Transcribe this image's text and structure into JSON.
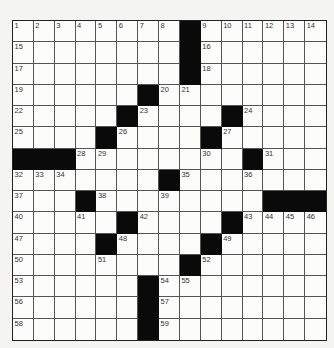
{
  "puzzle": {
    "rows": 15,
    "cols": 15,
    "black_cells": [
      [
        0,
        8
      ],
      [
        1,
        8
      ],
      [
        2,
        8
      ],
      [
        3,
        6
      ],
      [
        4,
        5
      ],
      [
        4,
        10
      ],
      [
        5,
        4
      ],
      [
        5,
        9
      ],
      [
        6,
        0
      ],
      [
        6,
        1
      ],
      [
        6,
        2
      ],
      [
        6,
        11
      ],
      [
        7,
        7
      ],
      [
        8,
        3
      ],
      [
        8,
        12
      ],
      [
        8,
        13
      ],
      [
        8,
        14
      ],
      [
        9,
        5
      ],
      [
        9,
        10
      ],
      [
        10,
        4
      ],
      [
        10,
        9
      ],
      [
        11,
        8
      ],
      [
        12,
        6
      ],
      [
        13,
        6
      ],
      [
        14,
        6
      ]
    ],
    "numbers": [
      {
        "n": "1",
        "r": 0,
        "c": 0
      },
      {
        "n": "2",
        "r": 0,
        "c": 1
      },
      {
        "n": "3",
        "r": 0,
        "c": 2
      },
      {
        "n": "4",
        "r": 0,
        "c": 3
      },
      {
        "n": "5",
        "r": 0,
        "c": 4
      },
      {
        "n": "6",
        "r": 0,
        "c": 5
      },
      {
        "n": "7",
        "r": 0,
        "c": 6
      },
      {
        "n": "8",
        "r": 0,
        "c": 7
      },
      {
        "n": "9",
        "r": 0,
        "c": 9
      },
      {
        "n": "10",
        "r": 0,
        "c": 10
      },
      {
        "n": "11",
        "r": 0,
        "c": 11
      },
      {
        "n": "12",
        "r": 0,
        "c": 12
      },
      {
        "n": "13",
        "r": 0,
        "c": 13
      },
      {
        "n": "14",
        "r": 0,
        "c": 14
      },
      {
        "n": "15",
        "r": 1,
        "c": 0
      },
      {
        "n": "16",
        "r": 1,
        "c": 9
      },
      {
        "n": "17",
        "r": 2,
        "c": 0
      },
      {
        "n": "18",
        "r": 2,
        "c": 9
      },
      {
        "n": "19",
        "r": 3,
        "c": 0
      },
      {
        "n": "20",
        "r": 3,
        "c": 7
      },
      {
        "n": "21",
        "r": 3,
        "c": 8
      },
      {
        "n": "22",
        "r": 4,
        "c": 0
      },
      {
        "n": "23",
        "r": 4,
        "c": 6
      },
      {
        "n": "24",
        "r": 4,
        "c": 11
      },
      {
        "n": "25",
        "r": 5,
        "c": 0
      },
      {
        "n": "26",
        "r": 5,
        "c": 5
      },
      {
        "n": "27",
        "r": 5,
        "c": 10
      },
      {
        "n": "28",
        "r": 6,
        "c": 3
      },
      {
        "n": "29",
        "r": 6,
        "c": 4
      },
      {
        "n": "30",
        "r": 6,
        "c": 9
      },
      {
        "n": "31",
        "r": 6,
        "c": 12
      },
      {
        "n": "32",
        "r": 7,
        "c": 0
      },
      {
        "n": "33",
        "r": 7,
        "c": 1
      },
      {
        "n": "34",
        "r": 7,
        "c": 2
      },
      {
        "n": "35",
        "r": 7,
        "c": 8
      },
      {
        "n": "36",
        "r": 7,
        "c": 11
      },
      {
        "n": "37",
        "r": 8,
        "c": 0
      },
      {
        "n": "38",
        "r": 8,
        "c": 4
      },
      {
        "n": "39",
        "r": 8,
        "c": 7
      },
      {
        "n": "40",
        "r": 9,
        "c": 0
      },
      {
        "n": "41",
        "r": 9,
        "c": 3
      },
      {
        "n": "42",
        "r": 9,
        "c": 6
      },
      {
        "n": "43",
        "r": 9,
        "c": 11
      },
      {
        "n": "44",
        "r": 9,
        "c": 12
      },
      {
        "n": "45",
        "r": 9,
        "c": 13
      },
      {
        "n": "46",
        "r": 9,
        "c": 14
      },
      {
        "n": "47",
        "r": 10,
        "c": 0
      },
      {
        "n": "48",
        "r": 10,
        "c": 5
      },
      {
        "n": "49",
        "r": 10,
        "c": 10
      },
      {
        "n": "50",
        "r": 11,
        "c": 0
      },
      {
        "n": "51",
        "r": 11,
        "c": 4
      },
      {
        "n": "52",
        "r": 11,
        "c": 9
      },
      {
        "n": "53",
        "r": 12,
        "c": 0
      },
      {
        "n": "54",
        "r": 12,
        "c": 7
      },
      {
        "n": "55",
        "r": 12,
        "c": 8
      },
      {
        "n": "56",
        "r": 13,
        "c": 0
      },
      {
        "n": "57",
        "r": 13,
        "c": 7
      },
      {
        "n": "58",
        "r": 14,
        "c": 0
      },
      {
        "n": "59",
        "r": 14,
        "c": 7
      }
    ],
    "colors": {
      "black": "#0a0a0a",
      "white": "#fcfcfa",
      "line": "#555555"
    }
  }
}
